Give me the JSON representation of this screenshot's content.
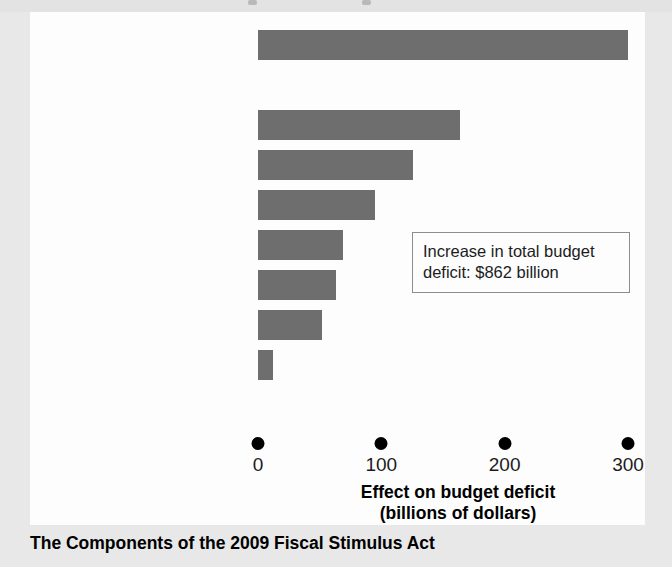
{
  "chart_data": {
    "type": "bar",
    "orientation": "horizontal",
    "title": "The Components of the 2009 Fiscal Stimulus Act",
    "xlabel": "Effect on budget deficit",
    "xlabel_line2": "(billions of dollars)",
    "ylabel": "",
    "xlim": [
      0,
      300
    ],
    "xticks": [
      0,
      100,
      200,
      300
    ],
    "xticklabels": [
      "0",
      "100",
      "200",
      "300"
    ],
    "grid": false,
    "legend": null,
    "bar_color": "#6e6e6e",
    "categories": [
      "Tax cuts",
      "State and local aid",
      "Infrastructure and science",
      "Protecting the vulnerable",
      "Health care",
      "Education and training",
      "Energy",
      "Other"
    ],
    "values": [
      300,
      164,
      126,
      95,
      69,
      63,
      52,
      12
    ],
    "group_header": "Spending increases",
    "annotation": "Increase in total budget deficit: $862 billion"
  },
  "rows": [
    {
      "label": "Tax cuts",
      "value": 300,
      "bold": true,
      "has_bar": true
    },
    {
      "label": "Spending increases",
      "value": null,
      "bold": true,
      "has_bar": false
    },
    {
      "label": "State and local aid",
      "value": 164,
      "bold": false,
      "has_bar": true
    },
    {
      "label": "Infrastructure and science",
      "value": 126,
      "bold": false,
      "has_bar": true
    },
    {
      "label": "Protecting the vulnerable",
      "value": 95,
      "bold": false,
      "has_bar": true
    },
    {
      "label": "Health care",
      "value": 69,
      "bold": false,
      "has_bar": true
    },
    {
      "label": "Education and training",
      "value": 63,
      "bold": false,
      "has_bar": true
    },
    {
      "label": "Energy",
      "value": 52,
      "bold": false,
      "has_bar": true
    },
    {
      "label": "Other",
      "value": 12,
      "bold": false,
      "has_bar": true
    }
  ],
  "axis": {
    "ticks": [
      {
        "value": 0,
        "label": "0"
      },
      {
        "value": 100,
        "label": "100"
      },
      {
        "value": 200,
        "label": "200"
      },
      {
        "value": 300,
        "label": "300"
      }
    ],
    "title_line1": "Effect on budget deficit",
    "title_line2": "(billions of dollars)"
  },
  "annotation": {
    "line1": "Increase in total budget",
    "line2": "deficit: $862 billion"
  },
  "caption": "The Components of the 2009 Fiscal Stimulus Act"
}
